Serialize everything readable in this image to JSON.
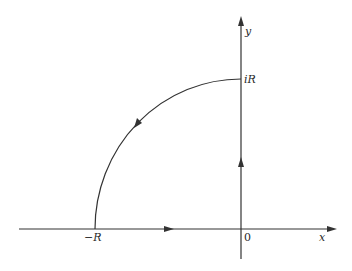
{
  "diagram": {
    "type": "contour",
    "colors": {
      "stroke": "#333333",
      "background": "#ffffff"
    },
    "axes": {
      "x_label": "x",
      "y_label": "y",
      "origin_label": "0"
    },
    "points": {
      "neg_R_label": "−R",
      "iR_label": "iR"
    },
    "segments": [
      {
        "name": "real-axis-segment",
        "from": "-R",
        "to": "0",
        "direction": "right"
      },
      {
        "name": "imaginary-axis-segment",
        "from": "0",
        "to": "iR",
        "direction": "up"
      },
      {
        "name": "arc-segment",
        "from": "iR",
        "to": "-R",
        "direction": "counterclockwise"
      }
    ]
  }
}
